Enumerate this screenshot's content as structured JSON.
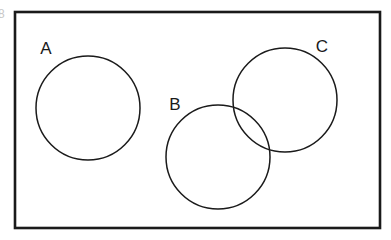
{
  "diagram": {
    "type": "venn-diagram",
    "title": "",
    "universe": {
      "name": "universal-set-rectangle",
      "shape": "rectangle",
      "x": 15,
      "y": 12,
      "width": 365,
      "height": 216,
      "stroke": "#1a1a1a",
      "stroke_width": 2.6,
      "fill": "#ffffff"
    },
    "background_color": "#ffffff",
    "stroke_color": "#1a1a1a",
    "circle_stroke_width": 1.5,
    "label_font_size": 17,
    "sets": [
      {
        "id": "A",
        "label": "A",
        "cx": 88,
        "cy": 108,
        "r": 52,
        "label_x": 46,
        "label_y": 54,
        "overlaps": []
      },
      {
        "id": "B",
        "label": "B",
        "cx": 218,
        "cy": 157,
        "r": 52,
        "label_x": 175,
        "label_y": 110,
        "overlaps": [
          "C"
        ]
      },
      {
        "id": "C",
        "label": "C",
        "cx": 285,
        "cy": 100,
        "r": 52,
        "label_x": 322,
        "label_y": 52,
        "overlaps": [
          "B"
        ]
      }
    ],
    "edge_artifact": {
      "text": "8",
      "x": 0,
      "y": 18,
      "color": "#c8c8c8",
      "font_size": 12
    }
  }
}
